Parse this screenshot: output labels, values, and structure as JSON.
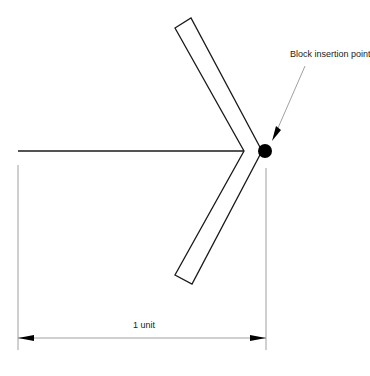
{
  "diagram": {
    "annotation_label": "Block insertion point",
    "dimension_label": "1 unit",
    "colors": {
      "stroke": "#1a1a1a",
      "thin_stroke": "#777777",
      "dot": "#000000",
      "background": "#ffffff"
    }
  }
}
